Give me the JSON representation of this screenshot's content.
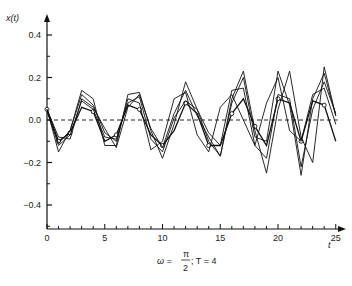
{
  "chart_data": {
    "type": "line",
    "title": "",
    "caption": "ω = π/2;  T = 4",
    "xlabel": "t",
    "ylabel": "x(t)",
    "xlim": [
      0,
      25
    ],
    "ylim": [
      -0.5,
      0.45
    ],
    "xticks": [
      0,
      5,
      10,
      15,
      20,
      25
    ],
    "yticks": [
      0.4,
      0.2,
      0.0,
      -0.2,
      -0.4
    ],
    "ytick_labels": [
      "0.4",
      "0.2",
      "0.0",
      "−0.2",
      "−0.4"
    ],
    "reference_line": {
      "y": 0.0,
      "style": "dashed"
    },
    "grid": false,
    "legend": null,
    "x": [
      0,
      1,
      2,
      3,
      4,
      5,
      6,
      7,
      8,
      9,
      10,
      11,
      12,
      13,
      14,
      15,
      16,
      17,
      18,
      19,
      20,
      21,
      22,
      23,
      24,
      25
    ],
    "series": [
      {
        "name": "marked",
        "markers": true,
        "values": [
          0.05,
          -0.1,
          -0.06,
          0.06,
          0.04,
          -0.1,
          -0.07,
          0.07,
          0.05,
          -0.07,
          -0.12,
          -0.05,
          0.08,
          0.03,
          -0.12,
          -0.12,
          0.03,
          0.1,
          -0.03,
          -0.12,
          0.1,
          0.08,
          -0.1,
          0.09,
          0.07,
          -0.1
        ]
      },
      {
        "name": "s2",
        "markers": false,
        "values": [
          0.05,
          -0.15,
          -0.05,
          0.14,
          0.1,
          -0.12,
          -0.12,
          0.12,
          0.13,
          -0.05,
          -0.18,
          -0.02,
          0.18,
          0.05,
          -0.1,
          -0.17,
          0.1,
          0.23,
          -0.05,
          -0.25,
          0.05,
          0.23,
          -0.08,
          -0.2,
          0.25,
          0.02
        ]
      },
      {
        "name": "s3",
        "markers": false,
        "values": [
          0.05,
          -0.08,
          -0.09,
          0.1,
          0.06,
          -0.04,
          -0.13,
          0.06,
          0.12,
          -0.04,
          -0.13,
          0.03,
          0.14,
          0.02,
          -0.08,
          -0.17,
          0.08,
          0.2,
          -0.08,
          -0.1,
          0.23,
          0.07,
          -0.26,
          0.1,
          0.22,
          0.02
        ]
      },
      {
        "name": "s4",
        "markers": false,
        "values": [
          0.04,
          -0.11,
          -0.05,
          0.12,
          0.07,
          -0.06,
          -0.1,
          0.1,
          0.08,
          -0.14,
          -0.1,
          0.1,
          0.13,
          -0.07,
          -0.15,
          0.06,
          0.12,
          0.0,
          -0.12,
          0.08,
          0.2,
          -0.05,
          -0.1,
          0.12,
          0.15,
          -0.02
        ]
      },
      {
        "name": "s5",
        "markers": false,
        "values": [
          0.05,
          -0.12,
          -0.07,
          0.09,
          0.05,
          -0.08,
          -0.09,
          0.08,
          0.11,
          -0.09,
          -0.15,
          0.01,
          0.09,
          0.05,
          -0.06,
          -0.12,
          0.14,
          0.15,
          -0.12,
          -0.18,
          0.12,
          0.1,
          -0.22,
          0.05,
          0.18,
          0.03
        ]
      }
    ]
  },
  "axes": {
    "ylabel": "x(t)",
    "xlabel": "t",
    "caption_omega": "ω =",
    "caption_pi": "π",
    "caption_two": "2",
    "caption_rest": ";  T = 4"
  }
}
